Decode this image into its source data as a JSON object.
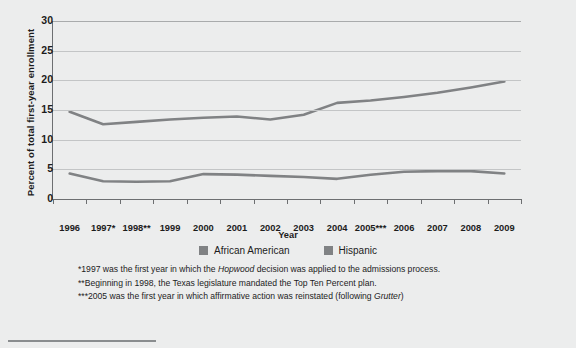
{
  "chart": {
    "type": "line",
    "ylabel": "Percent of total first-year enrollment",
    "xlabel": "Year"
  },
  "axes": {
    "y_ticks": [
      "0",
      "5",
      "10",
      "15",
      "20",
      "25",
      "30"
    ],
    "y_values": [
      0,
      5,
      10,
      15,
      20,
      25,
      30
    ],
    "x_ticks": [
      "1996",
      "1997*",
      "1998**",
      "1999",
      "2000",
      "2001",
      "2002",
      "2003",
      "2004",
      "2005***",
      "2006",
      "2007",
      "2008",
      "2009"
    ]
  },
  "legend": {
    "items": [
      {
        "label": "African American",
        "color": "#808284"
      },
      {
        "label": "Hispanic",
        "color": "#808284"
      }
    ]
  },
  "notes": [
    {
      "pre": "*1997 was the first year in which the ",
      "em": "Hopwood",
      "post": " decision was applied to the admissions process."
    },
    {
      "pre": "**Beginning in 1998, the Texas legislature mandated the Top Ten Percent plan.",
      "em": "",
      "post": ""
    },
    {
      "pre": "***2005 was the first year in which affirmative action was reinstated (following ",
      "em": "Grutter",
      "post": ")"
    }
  ],
  "chart_data": {
    "type": "line",
    "title": "",
    "xlabel": "Year",
    "ylabel": "Percent of total first-year enrollment",
    "ylim": [
      0,
      30
    ],
    "grid": true,
    "legend_position": "bottom-center",
    "categories": [
      "1996",
      "1997",
      "1998",
      "1999",
      "2000",
      "2001",
      "2002",
      "2003",
      "2004",
      "2005",
      "2006",
      "2007",
      "2008",
      "2009"
    ],
    "tick_labels": [
      "1996",
      "1997*",
      "1998**",
      "1999",
      "2000",
      "2001",
      "2002",
      "2003",
      "2004",
      "2005***",
      "2006",
      "2007",
      "2008",
      "2009"
    ],
    "series": [
      {
        "name": "Hispanic",
        "color": "#808284",
        "values": [
          14.7,
          12.6,
          13.0,
          13.4,
          13.7,
          13.9,
          13.4,
          14.2,
          16.2,
          16.6,
          17.2,
          17.9,
          18.8,
          19.8
        ]
      },
      {
        "name": "African American",
        "color": "#808284",
        "values": [
          4.3,
          3.0,
          2.9,
          3.0,
          4.2,
          4.1,
          3.9,
          3.7,
          3.4,
          4.1,
          4.6,
          4.7,
          4.7,
          4.3
        ]
      }
    ],
    "annotations": [
      "*1997 was the first year in which the Hopwood decision was applied to the admissions process.",
      "**Beginning in 1998, the Texas legislature mandated the Top Ten Percent plan.",
      "***2005 was the first year in which affirmative action was reinstated (following Grutter)"
    ]
  }
}
